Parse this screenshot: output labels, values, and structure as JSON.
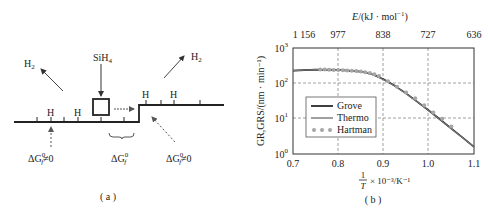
{
  "panel_a": {
    "caption": "( a )",
    "molecule_label": "SiH",
    "molecule_sub": "4",
    "h2_left": "H",
    "h2_left_sub": "2",
    "h2_right": "H",
    "h2_right_sub": "2",
    "h_atoms": [
      "H",
      "H",
      "H",
      "H"
    ],
    "dg_left": "ΔG",
    "dg_mid": "ΔG",
    "dg_right": "ΔG",
    "dg_sup": "0",
    "dg_sub": "f",
    "neq_zero": "≠0",
    "colors": {
      "line": "#222222",
      "dashed_arrow": "#555555",
      "arrow": "#444444"
    }
  },
  "panel_b": {
    "caption": "( b )"
  },
  "chart_data": {
    "type": "line",
    "title": "",
    "xlabel_num": "1",
    "xlabel_den": "T",
    "xlabel_rest": "× 10⁻³/K⁻¹",
    "ylabel": "GR,GRS/(nm · min⁻¹)",
    "top_xlabel": "E/(kJ · mol⁻¹)",
    "xlim": [
      0.7,
      1.1
    ],
    "ylim": [
      1,
      1000
    ],
    "yscale": "log",
    "x_ticks": [
      "0.7",
      "0.8",
      "0.9",
      "1.0",
      "1.1"
    ],
    "y_ticks": [
      "10",
      "10",
      "10",
      "10"
    ],
    "y_tick_exps": [
      "0",
      "1",
      "2",
      "3"
    ],
    "top_ticks": [
      "1 156",
      "977",
      "838",
      "727",
      "636"
    ],
    "grid": "dashed",
    "legend_position": "lower-left-inside",
    "legend": [
      "Grove",
      "Thermo",
      "Hartman"
    ],
    "series": [
      {
        "name": "Grove",
        "style": "solid-black",
        "x": [
          0.7,
          0.75,
          0.8,
          0.85,
          0.875,
          0.9,
          0.925,
          0.95,
          0.975,
          1.0,
          1.025,
          1.05,
          1.075,
          1.1
        ],
        "y": [
          230,
          245,
          240,
          215,
          180,
          130,
          85,
          52,
          30,
          17,
          9.5,
          5.2,
          2.9,
          1.6
        ]
      },
      {
        "name": "Thermo",
        "style": "solid-gray",
        "x": [
          0.7,
          0.75,
          0.8,
          0.85,
          0.875,
          0.9,
          0.925,
          0.95,
          0.975,
          1.0,
          1.025,
          1.05,
          1.075,
          1.1
        ],
        "y": [
          228,
          243,
          238,
          213,
          178,
          128,
          84,
          51,
          30,
          17,
          9.4,
          5.1,
          2.9,
          1.6
        ]
      },
      {
        "name": "Hartman",
        "style": "gray-dots",
        "x": [
          0.76,
          0.77,
          0.78,
          0.79,
          0.8,
          0.81,
          0.82,
          0.83,
          0.84,
          0.85,
          0.86,
          0.87,
          0.88,
          0.89,
          0.91,
          0.93,
          0.95,
          0.97,
          0.99,
          1.01,
          1.03,
          1.05
        ],
        "y": [
          245,
          245,
          243,
          240,
          238,
          235,
          232,
          228,
          222,
          215,
          205,
          195,
          180,
          160,
          115,
          80,
          55,
          38,
          24,
          15,
          10,
          6
        ]
      }
    ],
    "colors": {
      "Grove": "#111111",
      "Thermo": "#777777",
      "Hartman": "#a6a6a6",
      "grid": "#888888"
    }
  }
}
